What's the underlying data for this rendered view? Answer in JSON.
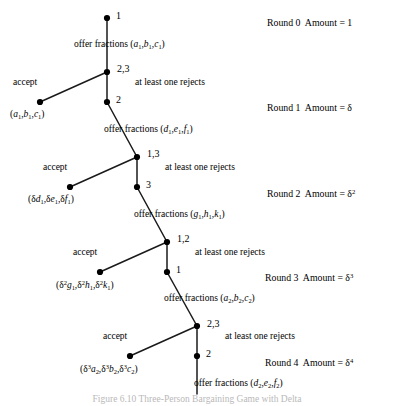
{
  "figure": {
    "caption_partial": "Figure 6.10  Three-Person Bargaining Game with Delta",
    "colors": {
      "line": "#1a1a1a",
      "node": "#000000",
      "text": "#000000",
      "background": "#ffffff"
    }
  },
  "nodes": [
    {
      "id": "n0",
      "player_label": "1",
      "x": 107,
      "y": 18,
      "type": "decision"
    },
    {
      "id": "n1",
      "player_label": "2,3",
      "x": 107,
      "y": 72,
      "type": "decision"
    },
    {
      "id": "t1",
      "player_label": "",
      "x": 40,
      "y": 102,
      "type": "terminal"
    },
    {
      "id": "n2",
      "player_label": "2",
      "x": 107,
      "y": 102,
      "type": "decision"
    },
    {
      "id": "n3",
      "player_label": "1,3",
      "x": 137,
      "y": 157,
      "type": "decision"
    },
    {
      "id": "t2",
      "player_label": "",
      "x": 70,
      "y": 187,
      "type": "terminal"
    },
    {
      "id": "n4",
      "player_label": "3",
      "x": 137,
      "y": 187,
      "type": "decision"
    },
    {
      "id": "n5",
      "player_label": "1,2",
      "x": 167,
      "y": 242,
      "type": "decision"
    },
    {
      "id": "t3",
      "player_label": "",
      "x": 100,
      "y": 272,
      "type": "terminal"
    },
    {
      "id": "n6",
      "player_label": "1",
      "x": 167,
      "y": 272,
      "type": "decision"
    },
    {
      "id": "n7",
      "player_label": "2,3",
      "x": 197,
      "y": 326,
      "type": "decision"
    },
    {
      "id": "t4",
      "player_label": "",
      "x": 130,
      "y": 356,
      "type": "terminal"
    },
    {
      "id": "n8",
      "player_label": "2",
      "x": 197,
      "y": 356,
      "type": "decision"
    }
  ],
  "edges": [
    {
      "from": "n0",
      "to": "n1",
      "kind": "offer"
    },
    {
      "from": "n1",
      "to": "t1",
      "kind": "accept"
    },
    {
      "from": "n1",
      "to": "n2",
      "kind": "reject"
    },
    {
      "from": "n2",
      "to": "n3",
      "kind": "offer"
    },
    {
      "from": "n3",
      "to": "t2",
      "kind": "accept"
    },
    {
      "from": "n3",
      "to": "n4",
      "kind": "reject"
    },
    {
      "from": "n4",
      "to": "n5",
      "kind": "offer"
    },
    {
      "from": "n5",
      "to": "t3",
      "kind": "accept"
    },
    {
      "from": "n5",
      "to": "n6",
      "kind": "reject"
    },
    {
      "from": "n6",
      "to": "n7",
      "kind": "offer"
    },
    {
      "from": "n7",
      "to": "t4",
      "kind": "accept"
    },
    {
      "from": "n7",
      "to": "n8",
      "kind": "reject"
    },
    {
      "from": "n8",
      "to": "continuation",
      "kind": "offer"
    }
  ],
  "player_labels": [
    {
      "text": "1",
      "x": 116,
      "y": 11
    },
    {
      "text": "2,3",
      "x": 117,
      "y": 64
    },
    {
      "text": "2",
      "x": 116,
      "y": 95
    },
    {
      "text": "1,3",
      "x": 147,
      "y": 149
    },
    {
      "text": "3",
      "x": 146,
      "y": 180
    },
    {
      "text": "1,2",
      "x": 177,
      "y": 234
    },
    {
      "text": "1",
      "x": 176,
      "y": 265
    },
    {
      "text": "2,3",
      "x": 207,
      "y": 319
    },
    {
      "text": "2",
      "x": 206,
      "y": 349
    }
  ],
  "offer_labels": [
    {
      "id": "offer1",
      "text_prefix": "offer fractions (",
      "vars": "a,b,c",
      "subscript": "1",
      "x": 74,
      "y": 40
    },
    {
      "id": "offer2",
      "text_prefix": "offer fractions (",
      "vars": "d,e,f",
      "subscript": "1",
      "x": 104,
      "y": 125
    },
    {
      "id": "offer3",
      "text_prefix": "offer fractions (",
      "vars": "g,h,k",
      "subscript": "1",
      "x": 134,
      "y": 210
    },
    {
      "id": "offer4",
      "text_prefix": "offer fractions (",
      "vars": "a,b,c",
      "subscript": "2",
      "x": 164,
      "y": 294
    },
    {
      "id": "offer5",
      "text_prefix": "offer fractions (",
      "vars": "d,e,f",
      "subscript": "2",
      "x": 194,
      "y": 379
    }
  ],
  "accept_labels": [
    {
      "text": "accept",
      "x": 13,
      "y": 78
    },
    {
      "text": "accept",
      "x": 43,
      "y": 163
    },
    {
      "text": "accept",
      "x": 73,
      "y": 248
    },
    {
      "text": "accept",
      "x": 103,
      "y": 332
    }
  ],
  "reject_labels": [
    {
      "text": "at least one rejects",
      "x": 135,
      "y": 78
    },
    {
      "text": "at least one rejects",
      "x": 165,
      "y": 163
    },
    {
      "text": "at least one rejects",
      "x": 195,
      "y": 248
    },
    {
      "text": "at least one rejects",
      "x": 225,
      "y": 332
    }
  ],
  "payoffs": [
    {
      "id": "p1",
      "x": 10,
      "y": 110,
      "terms": [
        {
          "coef": "",
          "coef_sup": "",
          "var": "a",
          "sub": "1"
        },
        {
          "coef": "",
          "coef_sup": "",
          "var": "b",
          "sub": "1"
        },
        {
          "coef": "",
          "coef_sup": "",
          "var": "c",
          "sub": "1"
        }
      ]
    },
    {
      "id": "p2",
      "x": 28,
      "y": 195,
      "terms": [
        {
          "coef": "δ",
          "coef_sup": "",
          "var": "d",
          "sub": "1"
        },
        {
          "coef": "δ",
          "coef_sup": "",
          "var": "e",
          "sub": "1"
        },
        {
          "coef": "δ",
          "coef_sup": "",
          "var": "f",
          "sub": "1"
        }
      ]
    },
    {
      "id": "p3",
      "x": 56,
      "y": 280,
      "terms": [
        {
          "coef": "δ",
          "coef_sup": "2",
          "var": "g",
          "sub": "1"
        },
        {
          "coef": "δ",
          "coef_sup": "2",
          "var": "h",
          "sub": "1"
        },
        {
          "coef": "δ",
          "coef_sup": "2",
          "var": "k",
          "sub": "1"
        }
      ]
    },
    {
      "id": "p4",
      "x": 80,
      "y": 364,
      "terms": [
        {
          "coef": "δ",
          "coef_sup": "3",
          "var": "a",
          "sub": "2"
        },
        {
          "coef": "δ",
          "coef_sup": "3",
          "var": "b",
          "sub": "2"
        },
        {
          "coef": "δ",
          "coef_sup": "3",
          "var": "c",
          "sub": "2"
        }
      ]
    }
  ],
  "rounds": [
    {
      "round_label": "Round 0",
      "amount_label": "Amount = ",
      "amount_base": "1",
      "amount_sup": "",
      "x": 267,
      "y": 18
    },
    {
      "round_label": "Round 1",
      "amount_label": "Amount = ",
      "amount_base": "δ",
      "amount_sup": "",
      "x": 267,
      "y": 103
    },
    {
      "round_label": "Round 2",
      "amount_label": "Amount = ",
      "amount_base": "δ",
      "amount_sup": "2",
      "x": 267,
      "y": 188
    },
    {
      "round_label": "Round 3",
      "amount_label": "Amount = ",
      "amount_base": "δ",
      "amount_sup": "3",
      "x": 265,
      "y": 272
    },
    {
      "round_label": "Round 4",
      "amount_label": "Amount = ",
      "amount_base": "δ",
      "amount_sup": "4",
      "x": 265,
      "y": 357
    }
  ]
}
